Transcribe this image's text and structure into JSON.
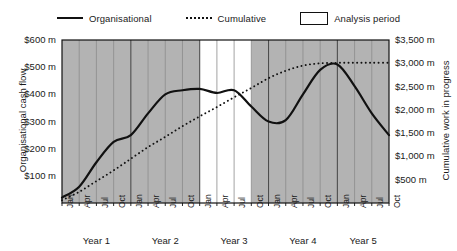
{
  "legend": {
    "items": [
      {
        "label": "Organisational",
        "style": "solid-line",
        "icon": "solid-line-icon"
      },
      {
        "label": "Cumulative",
        "style": "dotted-line",
        "icon": "dotted-line-icon"
      },
      {
        "label": "Analysis period",
        "style": "white-box",
        "icon": "white-rectangle-icon"
      }
    ]
  },
  "colors": {
    "line": "#111111",
    "shaded_band": "#b3b3b3",
    "analysis_band": "#ffffff",
    "gridline": "#8c8c8c",
    "axis": "#111111",
    "text": "#1a1a1a"
  },
  "chart_data": {
    "type": "line",
    "title": "",
    "xlabel": "",
    "grid": true,
    "legend_position": "top",
    "axes": {
      "left": {
        "label": "Organisational cash flow",
        "ticks": [
          "$100 m",
          "$200 m",
          "$300 m",
          "$400 m",
          "$500 m",
          "$600 m"
        ],
        "tick_values": [
          100,
          200,
          300,
          400,
          500,
          600
        ],
        "ylim": [
          0,
          600
        ],
        "unit": "m"
      },
      "right": {
        "label": "Cumulative work in progress",
        "ticks": [
          "$500 m",
          "$1,000 m",
          "$1,500 m",
          "$2,000 m",
          "$2,500 m",
          "$3,000 m",
          "$3,500 m"
        ],
        "tick_values": [
          500,
          1000,
          1500,
          2000,
          2500,
          3000,
          3500
        ],
        "ylim": [
          0,
          3500
        ],
        "unit": "m"
      }
    },
    "x_tick_labels": [
      "Jan",
      "Apr",
      "Jul",
      "Oct",
      "Jan",
      "Apr",
      "Jul",
      "Oct",
      "Jan",
      "Apr",
      "Jul",
      "Oct",
      "Jan",
      "Apr",
      "Jul",
      "Oct",
      "Jan",
      "Apr",
      "Jul",
      "Oct"
    ],
    "year_labels": [
      "Year 1",
      "Year 2",
      "Year 3",
      "Year 4",
      "Year 5"
    ],
    "analysis_period": {
      "start_label": "Year 3 Jan",
      "end_label": "Year 3 Oct",
      "start_index": 8,
      "end_index": 11
    },
    "series": [
      {
        "name": "Organisational",
        "axis": "left",
        "style": "solid",
        "x": [
          0,
          1,
          2,
          3,
          4,
          5,
          6,
          7,
          8,
          9,
          10,
          11,
          12,
          13,
          14,
          15,
          16,
          17,
          18,
          19
        ],
        "values": [
          20,
          60,
          150,
          225,
          250,
          330,
          400,
          415,
          420,
          405,
          415,
          355,
          300,
          305,
          400,
          490,
          510,
          430,
          330,
          250
        ]
      },
      {
        "name": "Cumulative",
        "axis": "right",
        "style": "dotted",
        "x": [
          0,
          1,
          2,
          3,
          4,
          5,
          6,
          7,
          8,
          9,
          10,
          11,
          12,
          13,
          14,
          15,
          16,
          17,
          18,
          19
        ],
        "values": [
          60,
          240,
          470,
          700,
          950,
          1200,
          1420,
          1650,
          1860,
          2060,
          2270,
          2470,
          2680,
          2840,
          2950,
          3000,
          3010,
          3010,
          3010,
          3010
        ]
      }
    ],
    "organisational_tail": {
      "end_value": 160,
      "note": "flattens near $150-160 m in Year 5"
    }
  }
}
